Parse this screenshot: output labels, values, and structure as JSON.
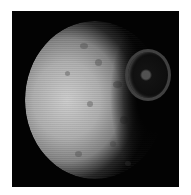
{
  "image": {
    "subject": "Cratered moon with large crater (Mimas with Herschel crater)",
    "background_color": "#ffffff",
    "frame_color": "#030303",
    "surface_color": "#b4b4b4"
  }
}
